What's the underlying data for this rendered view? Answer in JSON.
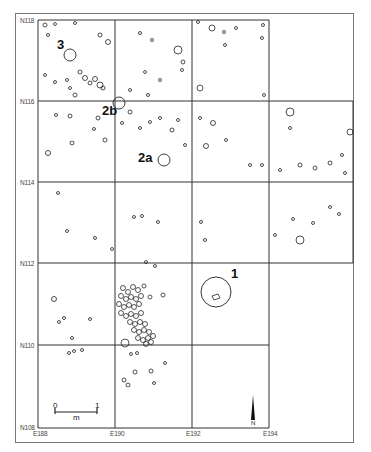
{
  "map": {
    "type": "archaeological excavation plan",
    "north_labels": [
      {
        "label": "N118",
        "y": 20
      },
      {
        "label": "N116",
        "y": 101
      },
      {
        "label": "N114",
        "y": 182
      },
      {
        "label": "N112",
        "y": 263
      },
      {
        "label": "N110",
        "y": 345
      },
      {
        "label": "N108",
        "y": 428
      }
    ],
    "east_labels": [
      {
        "label": "E188",
        "x": 38
      },
      {
        "label": "E190",
        "x": 115
      },
      {
        "label": "E192",
        "x": 192
      },
      {
        "label": "E194",
        "x": 269
      }
    ],
    "features": [
      {
        "id": "1",
        "label": "1",
        "circle": {
          "cx": 216,
          "cy": 292,
          "r": 15
        }
      },
      {
        "id": "2a",
        "label": "2a",
        "circle": {
          "cx": 164,
          "cy": 160,
          "r": 6
        }
      },
      {
        "id": "2b",
        "label": "2b",
        "circle": {
          "cx": 119,
          "cy": 103,
          "r": 6
        }
      },
      {
        "id": "3",
        "label": "3",
        "circle": {
          "cx": 70,
          "cy": 55,
          "r": 6
        }
      }
    ],
    "scale_bar": {
      "start_label": "0",
      "end_label": "1",
      "unit_label": "m"
    },
    "north_arrow": {
      "label": "N"
    }
  }
}
